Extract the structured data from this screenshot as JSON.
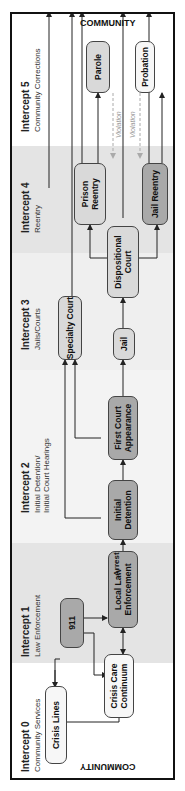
{
  "community_top": "COMMUNITY",
  "community_bottom": "COMMUNITY",
  "intercepts": [
    {
      "title": "Intercept 0",
      "subtitle": "Community Services"
    },
    {
      "title": "Intercept 1",
      "subtitle": "Law Enforcement"
    },
    {
      "title": "Intercept 2",
      "subtitle": "Initial Detention/\nInitial Court Hearings"
    },
    {
      "title": "Intercept 3",
      "subtitle": "Jails/Courts"
    },
    {
      "title": "Intercept 4",
      "subtitle": "Reentry"
    },
    {
      "title": "Intercept 5",
      "subtitle": "Community Corrections"
    }
  ],
  "nodes": {
    "crisis_lines": "Crisis Lines",
    "crisis_care": "Crisis Care\nContinuum",
    "n911": "911",
    "local_law": "Local Law\nEnforcement",
    "initial_detention": "Initial\nDetention",
    "first_court": "First Court\nAppearance",
    "specialty_court": "Specialty Court",
    "jail": "Jail",
    "dispositional_court": "Dispositional\nCourt",
    "prison_reentry": "Prison\nReentry",
    "jail_reentry": "Jail Reentry",
    "parole": "Parole",
    "probation": "Probation"
  },
  "labels": {
    "arrest": "Arrest",
    "violation1": "Violation",
    "violation2": "Violation"
  },
  "colors": {
    "shade": "#e4e4e4",
    "light": "#f1f1f1",
    "box_light": "#d9d9d9",
    "box_dark": "#a9a9a9",
    "box_white": "#f7f7f7"
  }
}
